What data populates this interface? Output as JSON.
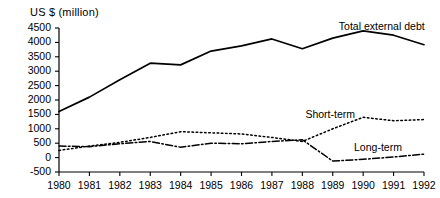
{
  "chart_data": {
    "type": "line",
    "title": "",
    "ylabel": "US $ (million)",
    "xlabel": "",
    "x": [
      1980,
      1981,
      1982,
      1983,
      1984,
      1985,
      1986,
      1987,
      1988,
      1989,
      1990,
      1991,
      1992
    ],
    "categories": [
      "1980",
      "1981",
      "1982",
      "1983",
      "1984",
      "1985",
      "1986",
      "1987",
      "1988",
      "1989",
      "1990",
      "1991",
      "1992"
    ],
    "ylim": [
      -500,
      4500
    ],
    "yticks": [
      -500,
      0,
      500,
      1000,
      1500,
      2000,
      2500,
      3000,
      3500,
      4000,
      4500
    ],
    "ytick_labels": [
      "-500",
      "0",
      "500",
      "1000",
      "1500",
      "2000",
      "2500",
      "3000",
      "3500",
      "4000",
      "4500"
    ],
    "grid": false,
    "legend": "inline-annotations",
    "series": [
      {
        "name": "Total external debt",
        "style": "solid",
        "color": "#000000",
        "label_x": 1989.2,
        "label_y": 4520,
        "values": [
          1600,
          2100,
          2700,
          3280,
          3220,
          3700,
          3880,
          4120,
          3780,
          4150,
          4400,
          4250,
          3920
        ]
      },
      {
        "name": "Short-term",
        "style": "dotted",
        "color": "#000000",
        "label_x": 1988.1,
        "label_y": 1480,
        "values": [
          250,
          400,
          530,
          700,
          900,
          860,
          820,
          700,
          560,
          1000,
          1400,
          1280,
          1320
        ]
      },
      {
        "name": "Long-term",
        "style": "dash-dot",
        "color": "#000000",
        "label_x": 1989.7,
        "label_y": 330,
        "values": [
          400,
          380,
          480,
          560,
          360,
          500,
          480,
          560,
          620,
          -120,
          -60,
          20,
          120
        ]
      }
    ]
  }
}
